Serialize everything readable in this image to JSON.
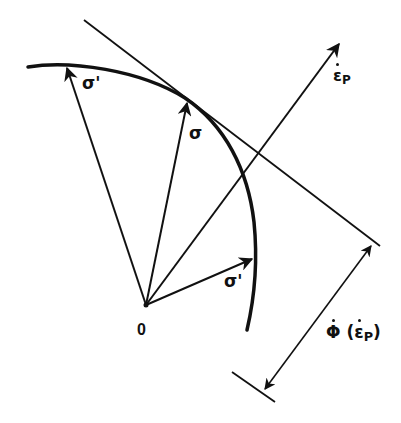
{
  "diagram": {
    "type": "plasticity-normality-rule",
    "colors": {
      "ink": "#111111",
      "background": "#ffffff"
    },
    "labels": {
      "origin": "0",
      "stress_left": "σ'",
      "stress_center": "σ",
      "stress_right": "σ'",
      "strain_rate_symbol": "ε",
      "strain_rate_subscript": "P",
      "dissipation_symbol": "Φ",
      "dissipation_arg_open": "(",
      "dissipation_arg_symbol": "ε",
      "dissipation_arg_subscript": "P",
      "dissipation_arg_close": ")"
    },
    "elements": {
      "yield_surface": "convex yield curve",
      "tangent_plane": "line tangent to yield curve at σ",
      "normal_vector": "plastic strain rate ε̇P normal to yield surface",
      "dimension": "distance Φ̇(ε̇P) between tangent and parallel line through origin"
    }
  }
}
